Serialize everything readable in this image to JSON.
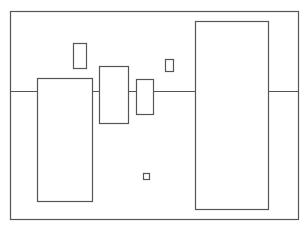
{
  "diagram": {
    "width": 308,
    "height": 228,
    "stroke_color": "#555555",
    "background": "#ffffff",
    "frame": {
      "x": 10,
      "y": 11,
      "w": 288,
      "h": 208
    },
    "baseline": {
      "y": 91,
      "x1": 10,
      "x2": 298
    },
    "boxes": [
      {
        "name": "left-tall-box",
        "x": 37,
        "y": 78,
        "w": 55,
        "h": 123
      },
      {
        "name": "small-upper-box",
        "x": 73,
        "y": 43,
        "w": 13,
        "h": 25
      },
      {
        "name": "mid-box",
        "x": 99,
        "y": 66,
        "w": 29,
        "h": 57
      },
      {
        "name": "narrow-box",
        "x": 136,
        "y": 79,
        "w": 17,
        "h": 35
      },
      {
        "name": "tiny-upper-box",
        "x": 165,
        "y": 59,
        "w": 8,
        "h": 12
      },
      {
        "name": "tiny-square",
        "x": 143,
        "y": 173,
        "w": 6,
        "h": 6
      },
      {
        "name": "right-tall-box",
        "x": 195,
        "y": 21,
        "w": 73,
        "h": 188
      }
    ]
  }
}
